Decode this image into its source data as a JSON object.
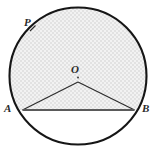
{
  "figure": {
    "type": "circle-geometry-diagram",
    "background_color": "#ffffff",
    "stroke_color": "#1a1a1a",
    "shade_color": "#e6e6e6",
    "chord_fill_color": "#ffffff",
    "labels": {
      "p": "P",
      "o": "O",
      "a": "A",
      "b": "B"
    },
    "geometry": {
      "circle_center_x": 78,
      "circle_center_y": 76,
      "circle_radius": 69,
      "center_point_o_x": 78,
      "center_point_o_y": 77,
      "triangle_apex_x": 78,
      "triangle_apex_y": 82,
      "point_a_x": 22,
      "point_a_y": 110,
      "point_b_x": 135,
      "point_b_y": 110,
      "point_p_x": 33,
      "point_p_y": 29,
      "chord_y": 110
    },
    "shaded_region": "major-segment",
    "tick_mark_on_arc_at": "P"
  }
}
